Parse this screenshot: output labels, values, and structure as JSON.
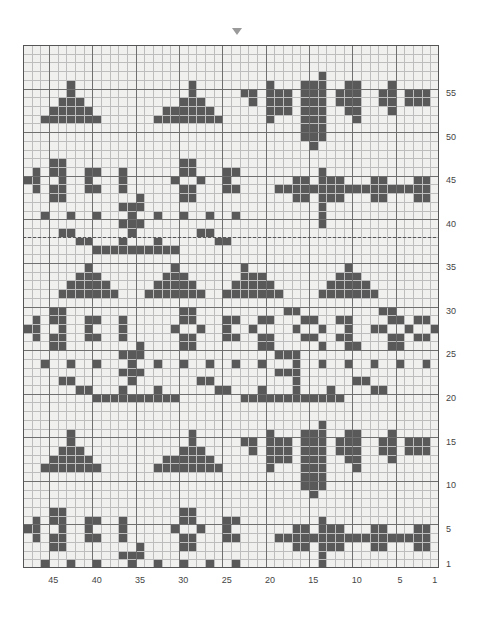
{
  "document": {
    "title": "Knitting Colourwork Chart",
    "kind": "stitch-chart"
  },
  "marker": {
    "name": "pattern-repeat-marker",
    "glyph": "▼",
    "column": 26
  },
  "palette": {
    "background": "#f0f0ef",
    "grid_minor": "#bdbdbd",
    "grid_major": "#6f6f6f",
    "border": "#555555",
    "dark_stitch": "#595959",
    "mid_stitch": "#7d7d7d",
    "label_text": "#444444",
    "repeat_line": "#555555"
  },
  "geometry": {
    "columns": 48,
    "rows": 60,
    "cell_w": 8.667,
    "cell_h": 8.717,
    "major_every": 5,
    "column_order": "right-to-left",
    "row_order": "bottom-to-top"
  },
  "axes": {
    "row_axis": {
      "name": "row-numbers",
      "position": "right",
      "ticks": [
        1,
        5,
        10,
        15,
        20,
        25,
        30,
        35,
        40,
        45,
        50,
        55
      ],
      "labels": [
        "1",
        "5",
        "10",
        "15",
        "20",
        "25",
        "30",
        "35",
        "40",
        "45",
        "50",
        "55"
      ]
    },
    "column_axis": {
      "name": "stitch-numbers",
      "position": "bottom",
      "ticks": [
        1,
        5,
        10,
        15,
        20,
        25,
        30,
        35,
        40,
        45
      ],
      "labels": [
        "1",
        "5",
        "10",
        "15",
        "20",
        "25",
        "30",
        "35",
        "40",
        "45"
      ]
    },
    "corner_row_label": "1",
    "corner_col_label": "1"
  },
  "repeat_lines": [
    {
      "name": "repeat-line-upper",
      "after_row": 38,
      "style": "dashed"
    }
  ],
  "chart_data": {
    "type": "heatmap",
    "xlabel": "",
    "ylabel": "",
    "legend": [
      {
        "key": 0,
        "name": "background",
        "color": "#f0f0ef"
      },
      {
        "key": 1,
        "name": "main-colour",
        "color": "#595959"
      },
      {
        "key": 2,
        "name": "contrast-colour",
        "color": "#7d7d7d"
      }
    ],
    "x": [
      48,
      47,
      46,
      45,
      44,
      43,
      42,
      41,
      40,
      39,
      38,
      37,
      36,
      35,
      34,
      33,
      32,
      31,
      30,
      29,
      28,
      27,
      26,
      25,
      24,
      23,
      22,
      21,
      20,
      19,
      18,
      17,
      16,
      15,
      14,
      13,
      12,
      11,
      10,
      9,
      8,
      7,
      6,
      5,
      4,
      3,
      2,
      1
    ],
    "y": [
      60,
      59,
      58,
      57,
      56,
      55,
      54,
      53,
      52,
      51,
      50,
      49,
      48,
      47,
      46,
      45,
      44,
      43,
      42,
      41,
      40,
      39,
      38,
      37,
      36,
      35,
      34,
      33,
      32,
      31,
      30,
      29,
      28,
      27,
      26,
      25,
      24,
      23,
      22,
      21,
      20,
      19,
      18,
      17,
      16,
      15,
      14,
      13,
      12,
      11,
      10,
      9,
      8,
      7,
      6,
      5,
      4,
      3,
      2,
      1
    ],
    "grid_note": "rows listed top (row 60) to bottom (row 1); each string has 48 chars, leftmost char = column 48",
    "rows": [
      "000000000000000000000000000000000000000000000000",
      "000000000000000000000000000000000000000000000000",
      "000000000000000000000000000000000000000000000000",
      "000000000000000000000000000000000010000000000000",
      "000001000000000000010000000010001110011000100000",
      "000001000000000000010000011011101110111001101110",
      "000011100000000000111000001011101110111001101110",
      "000111110000000011111100000011101110011000100000",
      "001111111000000111111110000010001110001000000000",
      "000000000000000000000000000000001110000000000000",
      "000000000000000000000000000000001110000000000000",
      "000000000000000000000000000000000100000000000000",
      "000000000000000000000000000000000000000000000000",
      "000110000000000000110000000000000000000000000000",
      "010110011001000000110001100000000010000000000000",
      "110010010001000001001001000000011011100011000110",
      "010110011001000000110001100001111111111111111110",
      "000110000000010000110000000000011011100011000110",
      "000000000001110000000000000000000010000000000000",
      "001001001000100100100100100000000010000000000000",
      "000000000001110000000000000000000010000000000000",
      "000011000000100000001100000000000000000000000000",
      "000000110001000100000011000000000000000000000000",
      "000000001111111111000000000000000000000000000000",
      "000000000000000000000000000000000000000000000000",
      "000000010000000001000000010000000000010000000000",
      "000000111000000011100000011100000000111000000000",
      "000001111100000111110000111110000001111100000000",
      "000011111110001111111001111111000011111110000000",
      "000000000000000000000000000000000000000000000000",
      "000110000000000000110000000000110000000001100000",
      "010110011001000000110001100110001100110000110110",
      "110010010001000001001001001000010010010011001001",
      "010110011001000000110001100110001100110000110110",
      "000110000000010000110000000110000010011000110000",
      "000000000001110000000000000001110000000000000000",
      "001001001000100100100100100100010010010010010010",
      "000000000001110000000000000001110000000000000000",
      "000011000000100000001100000000010000001100000000",
      "000000110001000100000011000100010001000011000000",
      "000000001111111111000000011111111111100000000000",
      "000000000000000000000000000000000000000000000000",
      "000000000000000000000000000000000000000000000000",
      "000000000000000000000000000000000010000000000000",
      "000001000000000000010000000010001110011000100000",
      "000001000000000000010000011011101110111001101110",
      "000011100000000000111000001011101110111001101110",
      "000111110000000011111100000011101110011000100000",
      "001111111000000111111110000010001110001000000000",
      "000000000000000000000000000000001110000000000000",
      "000000000000000000000000000000001110000000000000",
      "000000000000000000000000000000000100000000000000",
      "000000000000000000000000000000000000000000000000",
      "000110000000000000110000000000000000000000000000",
      "010110011001000000110001100000000010000000000000",
      "110010010001000001001001000000011011100011000110",
      "010110011001000000110001100001111111111111111110",
      "000110000000010000110000000000011011100011000110",
      "000000000001110000000000000000000010000000000000",
      "001001001000100100100100100000000010000000000000"
    ]
  }
}
